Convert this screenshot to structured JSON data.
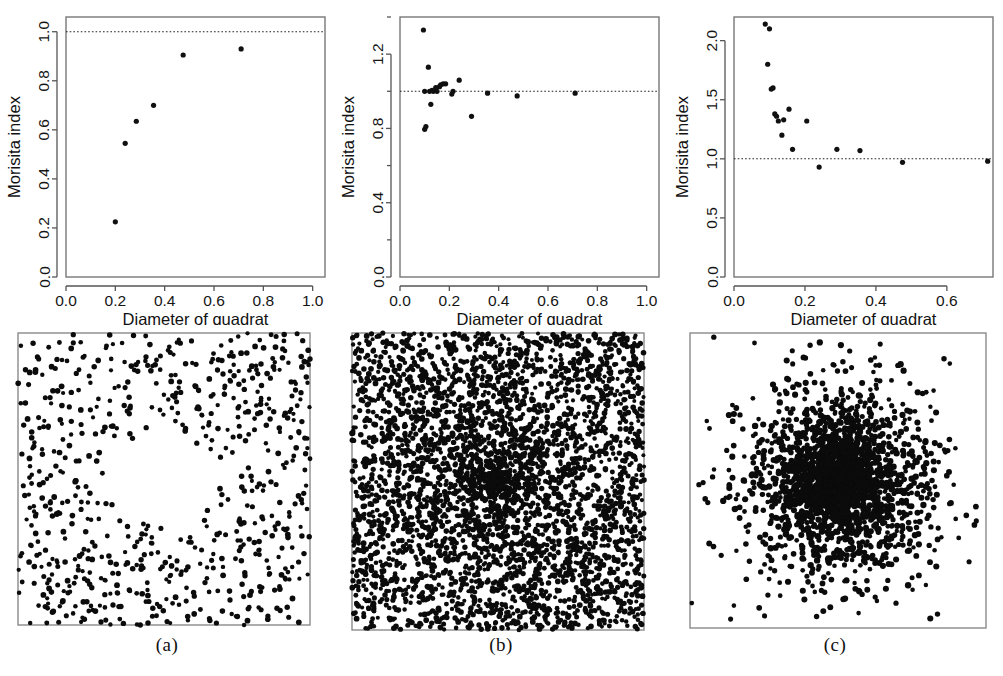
{
  "figure": {
    "panel_captions": [
      "(a)",
      "(b)",
      "(c)"
    ],
    "axis_titles": {
      "x": "Diameter of quadrat",
      "y": "Morisita index"
    },
    "reference_line_value": 1.0
  },
  "chart_data": [
    {
      "type": "scatter",
      "panel": "(a)",
      "title": "",
      "xlabel": "Diameter of quadrat",
      "ylabel": "Morisita index",
      "xlim": [
        0.0,
        1.05
      ],
      "ylim": [
        0.0,
        1.06
      ],
      "xticks": [
        "0.0",
        "0.2",
        "0.4",
        "0.6",
        "0.8",
        "1.0"
      ],
      "xtick_values": [
        0.0,
        0.2,
        0.4,
        0.6,
        0.8,
        1.0
      ],
      "yticks": [
        "0.0",
        "0.2",
        "0.4",
        "0.6",
        "0.8",
        "1.0"
      ],
      "ytick_values": [
        0.0,
        0.2,
        0.4,
        0.6,
        0.8,
        1.0
      ],
      "grid": false,
      "legend": "none",
      "annotations": [
        "dotted horizontal reference line at Morisita index = 1.0"
      ],
      "x": [
        0.2,
        0.24,
        0.285,
        0.355,
        0.475,
        0.71
      ],
      "y": [
        0.225,
        0.545,
        0.635,
        0.7,
        0.905,
        0.93
      ]
    },
    {
      "type": "scatter",
      "panel": "(b)",
      "title": "",
      "xlabel": "Diameter of quadrat",
      "ylabel": "Morisita index",
      "xlim": [
        0.0,
        1.05
      ],
      "ylim": [
        0.0,
        1.4
      ],
      "xticks": [
        "0.0",
        "0.2",
        "0.4",
        "0.6",
        "0.8",
        "1.0"
      ],
      "xtick_values": [
        0.0,
        0.2,
        0.4,
        0.6,
        0.8,
        1.0
      ],
      "yticks": [
        "0.0",
        "0.4",
        "0.8",
        "1.2"
      ],
      "ytick_values": [
        0.0,
        0.4,
        0.8,
        1.2
      ],
      "yminor_values": [
        0.2,
        0.6,
        1.0,
        1.4
      ],
      "grid": false,
      "legend": "none",
      "annotations": [
        "dotted horizontal reference line at Morisita index = 1.0"
      ],
      "x": [
        0.095,
        0.1,
        0.1,
        0.105,
        0.115,
        0.12,
        0.125,
        0.13,
        0.135,
        0.145,
        0.15,
        0.16,
        0.165,
        0.175,
        0.185,
        0.21,
        0.215,
        0.24,
        0.29,
        0.355,
        0.475,
        0.71
      ],
      "y": [
        1.33,
        1.0,
        0.795,
        0.81,
        1.13,
        1.0,
        0.93,
        1.005,
        1.0,
        1.02,
        1.0,
        1.025,
        1.035,
        1.04,
        1.04,
        0.985,
        1.0,
        1.06,
        0.865,
        0.99,
        0.975,
        0.99
      ]
    },
    {
      "type": "scatter",
      "panel": "(c)",
      "title": "",
      "xlabel": "Diameter of quadrat",
      "ylabel": "Morisita index",
      "xlim": [
        0.0,
        0.73
      ],
      "ylim": [
        0.0,
        2.2
      ],
      "xticks": [
        "0.0",
        "0.2",
        "0.4",
        "0.6"
      ],
      "xtick_values": [
        0.0,
        0.2,
        0.4,
        0.6
      ],
      "yticks": [
        "0.0",
        "0.5",
        "1.0",
        "1.5",
        "2.0"
      ],
      "ytick_values": [
        0.0,
        0.5,
        1.0,
        1.5,
        2.0
      ],
      "grid": false,
      "legend": "none",
      "annotations": [
        "dotted horizontal reference line at Morisita index = 1.0"
      ],
      "x": [
        0.088,
        0.1,
        0.095,
        0.105,
        0.11,
        0.115,
        0.12,
        0.125,
        0.135,
        0.155,
        0.14,
        0.165,
        0.205,
        0.24,
        0.29,
        0.355,
        0.475,
        0.715
      ],
      "y": [
        2.14,
        2.1,
        1.8,
        1.59,
        1.6,
        1.38,
        1.36,
        1.32,
        1.2,
        1.42,
        1.33,
        1.08,
        1.32,
        0.93,
        1.08,
        1.07,
        0.97,
        0.98
      ]
    }
  ],
  "point_patterns": [
    {
      "panel": "(a)",
      "description": "inhibition-pattern point process with central circular void",
      "approx_point_count": 700,
      "seed": 11,
      "mode": "hole"
    },
    {
      "panel": "(b)",
      "description": "dense random Poisson point pattern",
      "approx_point_count": 3200,
      "seed": 23,
      "mode": "poisson"
    },
    {
      "panel": "(c)",
      "description": "aggregated Gaussian cluster point pattern",
      "approx_point_count": 2600,
      "seed": 37,
      "mode": "cluster"
    }
  ]
}
